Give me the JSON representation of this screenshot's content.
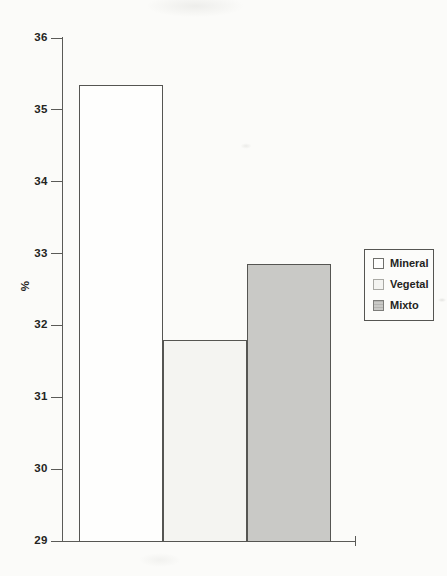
{
  "chart_data": {
    "type": "bar",
    "title": "",
    "xlabel": "",
    "ylabel": "%",
    "ylim": [
      29,
      36
    ],
    "yticks": [
      36,
      35,
      34,
      33,
      32,
      31,
      30,
      29
    ],
    "grid": false,
    "categories": [
      "Mineral",
      "Vegetal",
      "Mixto"
    ],
    "values": [
      35.35,
      31.8,
      32.85
    ],
    "legend": {
      "position": "right",
      "entries": [
        {
          "label": "Mineral",
          "fill": "#fefefd",
          "border": "#6f6f6b",
          "pattern": "none"
        },
        {
          "label": "Vegetal",
          "fill": "#f4f4f1",
          "border": "#a9a9a4",
          "pattern": "none"
        },
        {
          "label": "Mixto",
          "fill": "#c9c9c6",
          "border": "#7d7d7a",
          "pattern": "hlines"
        }
      ]
    }
  },
  "style": {
    "axis_color": "#5a5a57",
    "text_color": "#242422",
    "bar_border_color": "#555552",
    "background": "#fbfbf9"
  }
}
